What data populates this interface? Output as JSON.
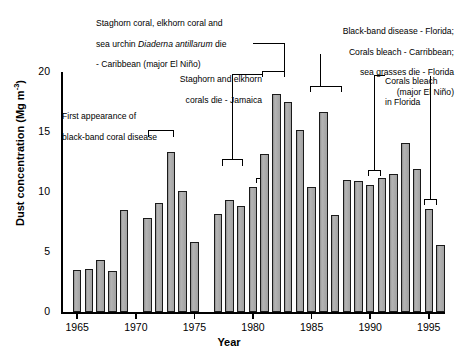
{
  "chart_data": {
    "type": "bar",
    "title": "",
    "xlabel": "Year",
    "ylabel": "Dust concentration (Mg m-3)",
    "ylabel_html": "Dust concentration (Mg m<sup>-3</sup>)",
    "ylim": [
      0,
      20
    ],
    "yticks": [
      0,
      5,
      10,
      15,
      20
    ],
    "xticks": [
      1965,
      1970,
      1975,
      1980,
      1985,
      1990,
      1995
    ],
    "xlim": [
      1964.2,
      1996.8
    ],
    "grid": false,
    "legend": null,
    "bar_fill": "#a8a8a8",
    "bar_edge": "#1a1a1a",
    "categories": [
      1965,
      1966,
      1967,
      1968,
      1969,
      1970,
      1971,
      1972,
      1973,
      1974,
      1975,
      1976,
      1977,
      1978,
      1979,
      1980,
      1981,
      1982,
      1983,
      1984,
      1985,
      1986,
      1987,
      1988,
      1989,
      1990,
      1991,
      1992,
      1993,
      1994,
      1995,
      1996
    ],
    "values": [
      3.5,
      3.6,
      4.3,
      3.4,
      8.5,
      null,
      7.8,
      9.1,
      13.3,
      10.1,
      5.8,
      null,
      8.2,
      9.3,
      8.8,
      10.4,
      13.2,
      18.2,
      17.5,
      15.2,
      10.4,
      16.7,
      8.1,
      11.0,
      10.9,
      10.6,
      11.2,
      11.5,
      14.1,
      11.9,
      8.6,
      5.6
    ],
    "missing_years": [
      1970,
      1976
    ]
  },
  "annotations": [
    {
      "id": "first-appearance",
      "text_line1": "First appearance of",
      "text_line2": "black-band coral disease",
      "target_years": [
        1973,
        1974
      ]
    },
    {
      "id": "staghorn-jamaica",
      "text_line1": "Staghorn and elkhorn",
      "text_line2": "corals die - Jamaica",
      "target_years": [
        1980
      ]
    },
    {
      "id": "staghorn-elkhorn-urchin",
      "text_line1": "Staghorn coral, elkhorn coral and",
      "text_line2_a": "sea urchin ",
      "text_line2_italic": "Diaderna antillarum",
      "text_line2_b": " die",
      "text_line3": "- Caribbean (major El Niño)",
      "target_years": [
        1982,
        1983
      ]
    },
    {
      "id": "black-band-florida",
      "text_line1": "Black-band disease - Florida;",
      "text_line2": "Corals bleach - Carribbean;",
      "text_line3": "sea grasses die - Florida",
      "text_line4": "(major El Niño)",
      "target_years": [
        1985,
        1986
      ]
    },
    {
      "id": "corals-bleach-florida",
      "text_line1": "Corals bleach",
      "text_line2": "in Florida",
      "target_years": [
        1990,
        1994
      ]
    }
  ]
}
